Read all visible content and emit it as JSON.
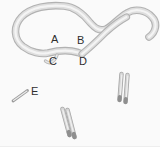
{
  "figure": {
    "labels": [
      {
        "id": "A",
        "text": "A"
      },
      {
        "id": "B",
        "text": "B"
      },
      {
        "id": "C",
        "text": "C"
      },
      {
        "id": "D",
        "text": "D"
      },
      {
        "id": "E",
        "text": "E"
      }
    ],
    "shapes": [
      {
        "name": "looped-cord",
        "description_name": "large-self-crossing-loop"
      },
      {
        "name": "hook-fragment",
        "description_name": "small-curl-near-C"
      },
      {
        "name": "paired-rods-right",
        "description_name": "two-parallel-vertical-rods"
      },
      {
        "name": "paired-rods-bottom",
        "description_name": "two-parallel-tilted-rods"
      },
      {
        "name": "small-rod-e",
        "description_name": "short-diagonal-rod"
      }
    ]
  },
  "colors": {
    "background": "#fafafa",
    "tube_edge": "#b2b2b2",
    "tube_fill": "#dedede",
    "tube_highlight": "#f4f4f4",
    "rod_edge": "#a6a6a6",
    "rod_fill": "#d6d6d6",
    "label_text": "#2e2e2e",
    "bottom_strip": "#ffffff"
  }
}
